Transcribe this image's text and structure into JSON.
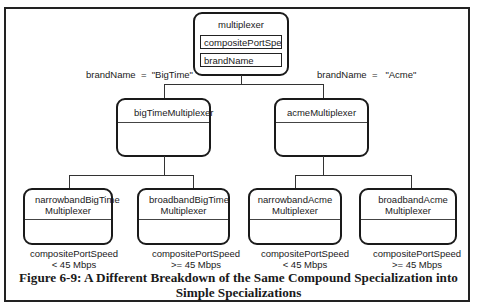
{
  "figure": {
    "caption_line1": "Figure 6-9: A Different Breakdown of the Same Compound Specialization into",
    "caption_line2": "Simple Specializations"
  },
  "root": {
    "name": "multiplexer",
    "attributes": [
      "compositePortSpeed",
      "brandName"
    ]
  },
  "level1": [
    {
      "discriminator": "brandName  =  \"BigTime\"",
      "name": "bigTimeMultiplexer"
    },
    {
      "discriminator": "brandName  =   \"Acme\"",
      "name": "acmeMultiplexer"
    }
  ],
  "level2": [
    {
      "name_line1": "narrowbandBigTime",
      "name_line2": "Multiplexer",
      "cond_line1": "compositePortSpeed",
      "cond_line2": "< 45 Mbps"
    },
    {
      "name_line1": "broadbandBigTime",
      "name_line2": "Multiplexer",
      "cond_line1": "compositePortSpeed",
      "cond_line2": ">= 45 Mbps"
    },
    {
      "name_line1": "narrowbandAcme",
      "name_line2": "Multiplexer",
      "cond_line1": "compositePortSpeed",
      "cond_line2": "<  45 Mbps"
    },
    {
      "name_line1": "broadbandAcme",
      "name_line2": "Multiplexer",
      "cond_line1": "compositePortSpeed",
      "cond_line2": ">= 45 Mbps"
    }
  ]
}
